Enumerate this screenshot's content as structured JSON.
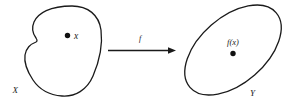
{
  "diagram": {
    "kind": "function-mapping-diagram",
    "background_color": "#ffffff",
    "stroke_color": "#1a1a1a",
    "domain_set": {
      "shape": "bean-blob",
      "label": "X",
      "element_label": "x",
      "element_dot": "filled-dot"
    },
    "codomain_set": {
      "shape": "tilted-ellipse",
      "label": "Y",
      "element_label": "f(x)",
      "element_dot": "filled-dot"
    },
    "mapping_arrow": {
      "label": "f",
      "direction": "left-to-right"
    }
  }
}
